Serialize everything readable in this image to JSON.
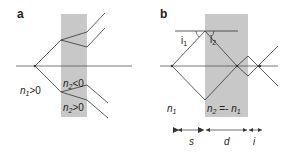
{
  "colors": {
    "slab": "#c8c8c8",
    "line": "#333333",
    "axis": "#555555",
    "background": "#ffffff"
  },
  "panel_a": {
    "label": "a",
    "medium_label_n": "n",
    "medium_label_sub": "1",
    "medium_label_rel": ">0",
    "neg_label_n": "n",
    "neg_label_sub": "2",
    "neg_label_rel": "<0",
    "pos_label_n": "n",
    "pos_label_sub": "2",
    "pos_label_rel": ">0"
  },
  "panel_b": {
    "label": "b",
    "angle1_i": "i",
    "angle1_sub": "1",
    "angle2_i": "i",
    "angle2_sub": "2",
    "medium_label_n": "n",
    "medium_label_sub": "1",
    "slab_label_n": "n",
    "slab_label_sub": "2",
    "slab_label_eq": " =- ",
    "slab_label_n1": "n",
    "slab_label_n1_sub": "1",
    "dim_s": "s",
    "dim_d": "d",
    "dim_i": "i"
  }
}
